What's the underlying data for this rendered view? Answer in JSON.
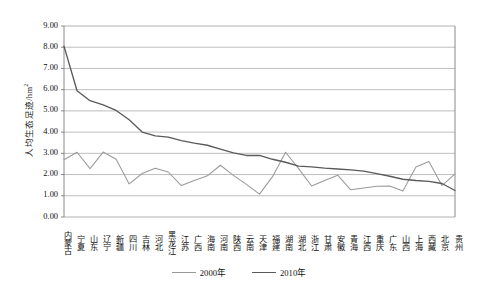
{
  "chart_data": {
    "type": "line",
    "title": "",
    "xlabel": "",
    "ylabel": "人均生态足迹/hm²",
    "ylabel_main": "人均生态足迹/hm",
    "ylabel_sup": "2",
    "ylim": [
      0,
      9
    ],
    "ytick_step": 1,
    "grid": true,
    "legend_position": "bottom",
    "yticks": [
      "0.00",
      "1.00",
      "2.00",
      "3.00",
      "4.00",
      "5.00",
      "6.00",
      "7.00",
      "8.00",
      "9.00"
    ],
    "categories": [
      "内蒙古",
      "宁夏",
      "山东",
      "辽宁",
      "新疆",
      "四川",
      "吉林",
      "河北",
      "黑龙江",
      "江苏",
      "广西",
      "海南",
      "河南",
      "陕西",
      "云南",
      "天津",
      "福建",
      "湖南",
      "湖北",
      "浙江",
      "甘肃",
      "安徽",
      "青海",
      "江西",
      "重庆",
      "广东",
      "山西",
      "上海",
      "西藏",
      "北京",
      "贵州"
    ],
    "series": [
      {
        "name": "2000年",
        "color": "#9a9a9a",
        "values": [
          2.7,
          3.05,
          2.28,
          3.06,
          2.72,
          1.56,
          2.05,
          2.3,
          2.12,
          1.48,
          1.72,
          1.94,
          2.44,
          1.96,
          1.54,
          1.08,
          1.9,
          3.05,
          2.28,
          1.46,
          1.72,
          1.97,
          1.28,
          1.37,
          1.45,
          1.46,
          1.22,
          2.36,
          2.62,
          1.48,
          2.03
        ]
      },
      {
        "name": "2010年",
        "color": "#5a5a5a",
        "values": [
          8.05,
          5.95,
          5.48,
          5.28,
          5.02,
          4.58,
          4.0,
          3.82,
          3.76,
          3.6,
          3.48,
          3.38,
          3.2,
          3.02,
          2.9,
          2.9,
          2.72,
          2.58,
          2.4,
          2.36,
          2.3,
          2.26,
          2.22,
          2.16,
          2.04,
          1.92,
          1.78,
          1.72,
          1.68,
          1.58,
          1.25
        ]
      }
    ],
    "legend": [
      {
        "label": "2000年",
        "color": "#9a9a9a"
      },
      {
        "label": "2010年",
        "color": "#5a5a5a"
      }
    ],
    "plot_geometry": {
      "left": 64,
      "right": 455,
      "top": 26,
      "bottom": 217
    },
    "axis_color": "#7d7d7d",
    "grid_color": "#a8a8a8"
  }
}
